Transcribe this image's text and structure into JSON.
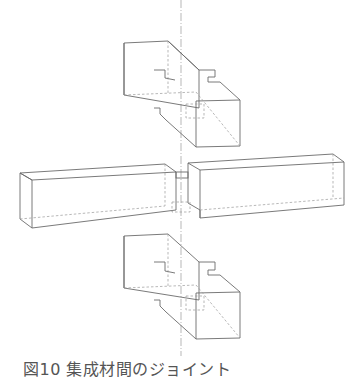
{
  "figure": {
    "caption": "図10 集成材間のジョイント",
    "colors": {
      "line": "#6b6b6b",
      "hidden": "#9a9a9a",
      "background": "#ffffff"
    }
  }
}
